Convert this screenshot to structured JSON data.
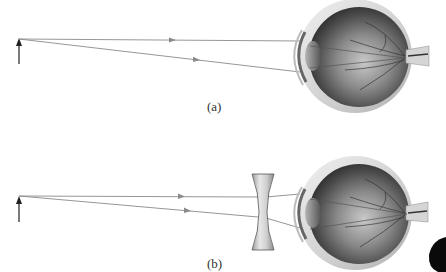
{
  "figure": {
    "panels": [
      {
        "id": "a",
        "label": "(a)",
        "elements": [
          "object-arrow",
          "parallel-ray",
          "oblique-ray",
          "eyeball"
        ],
        "corrective_lens": false
      },
      {
        "id": "b",
        "label": "(b)",
        "elements": [
          "object-arrow",
          "parallel-ray",
          "oblique-ray",
          "diverging-lens",
          "eyeball"
        ],
        "corrective_lens": true,
        "lens_type": "diverging (concave)"
      }
    ]
  },
  "colors": {
    "ray": "#8a8a8a",
    "arrow": "#222222",
    "sclera": "#d9d9d9",
    "eye_interior": "#555555",
    "lens": "#bdbdbd"
  }
}
